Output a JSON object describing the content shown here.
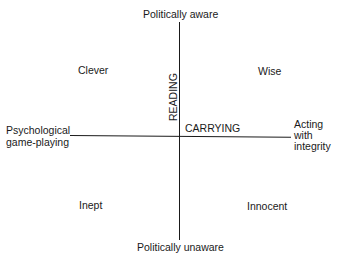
{
  "diagram": {
    "type": "quadrant",
    "vertical_axis": {
      "top_label": "Politically aware",
      "bottom_label": "Politically unaware",
      "axis_name": "READING"
    },
    "horizontal_axis": {
      "left_label_line1": "Psychological",
      "left_label_line2": "game-playing",
      "right_label_line1": "Acting",
      "right_label_line2": "with",
      "right_label_line3": "integrity",
      "axis_name": "CARRYING"
    },
    "quadrants": {
      "top_left": "Clever",
      "top_right": "Wise",
      "bottom_left": "Inept",
      "bottom_right": "Innocent"
    }
  }
}
